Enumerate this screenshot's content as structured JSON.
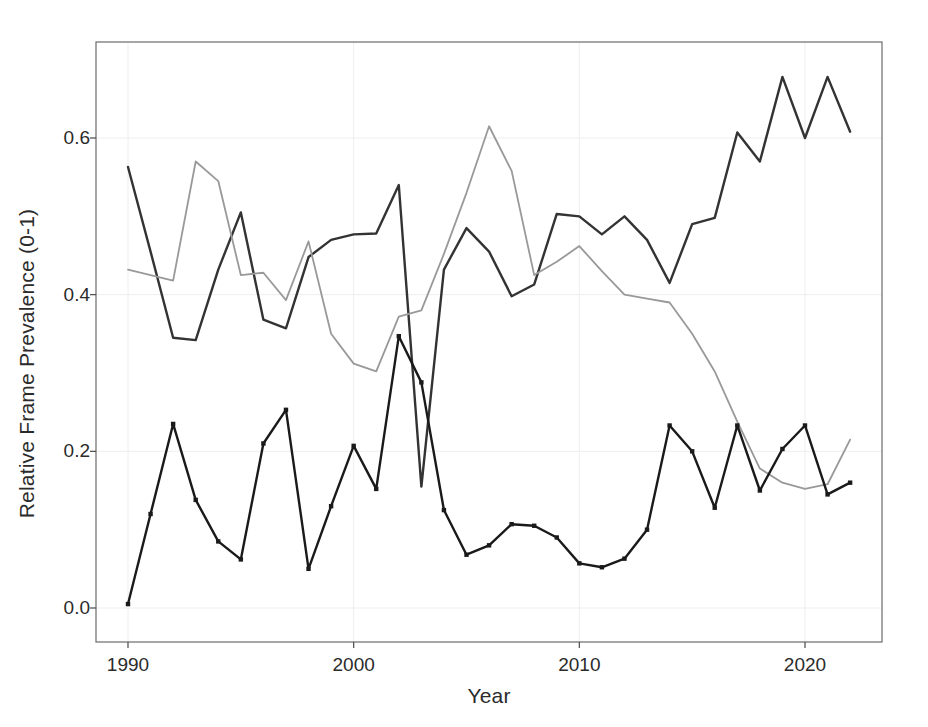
{
  "chart_data": {
    "type": "line",
    "title": "",
    "subtitle": "",
    "xlabel": "Year",
    "ylabel": "Relative Frame Prevalence (0-1)",
    "xlim": [
      1989.0,
      1989.0
    ],
    "ylim": [
      -0.035,
      0.715
    ],
    "xticks": [
      1990,
      2000,
      2010,
      2020
    ],
    "xtick_labels": [
      "1990",
      "2000",
      "2010",
      "2020"
    ],
    "yticks": [
      0.0,
      0.2,
      0.4,
      0.6
    ],
    "ytick_labels": [
      "0.0",
      "0.2",
      "0.4",
      "0.6"
    ],
    "grid": true,
    "grid_color": "#eeeeee",
    "legend": "none",
    "x": [
      1990,
      1991,
      1992,
      1993,
      1994,
      1995,
      1996,
      1997,
      1998,
      1999,
      2000,
      2001,
      2002,
      2003,
      2004,
      2005,
      2006,
      2007,
      2008,
      2009,
      2010,
      2011,
      2012,
      2013,
      2014,
      2015,
      2016,
      2017,
      2018,
      2019,
      2020,
      2021,
      2022
    ],
    "series": [
      {
        "name": "series-dark-upper",
        "color": "#333333",
        "markers": false,
        "linewidth": 2.4,
        "values": [
          0.563,
          0.455,
          0.345,
          0.342,
          0.432,
          0.505,
          0.368,
          0.357,
          0.448,
          0.47,
          0.477,
          0.478,
          0.54,
          0.155,
          0.432,
          0.485,
          0.455,
          0.398,
          0.413,
          0.503,
          0.5,
          0.477,
          0.5,
          0.47,
          0.415,
          0.49,
          0.498,
          0.607,
          0.57,
          0.678,
          0.6,
          0.678,
          0.608
        ]
      },
      {
        "name": "series-gray",
        "color": "#999999",
        "markers": false,
        "linewidth": 1.8,
        "values": [
          0.432,
          0.425,
          0.418,
          0.57,
          0.545,
          0.425,
          0.428,
          0.393,
          0.468,
          0.35,
          0.312,
          0.302,
          0.372,
          0.38,
          0.452,
          0.53,
          0.615,
          0.558,
          0.425,
          0.442,
          0.462,
          0.43,
          0.4,
          0.395,
          0.39,
          0.35,
          0.302,
          0.238,
          0.178,
          0.16,
          0.152,
          0.158,
          0.215
        ]
      },
      {
        "name": "series-dark-lower-markers",
        "color": "#1a1a1a",
        "markers": true,
        "linewidth": 2.4,
        "values": [
          0.005,
          0.12,
          0.235,
          0.138,
          0.085,
          0.062,
          0.21,
          0.253,
          0.05,
          0.13,
          0.207,
          0.152,
          0.347,
          0.288,
          0.125,
          0.068,
          0.08,
          0.107,
          0.105,
          0.09,
          0.057,
          0.052,
          0.063,
          0.1,
          0.233,
          0.2,
          0.128,
          0.233,
          0.15,
          0.203,
          0.233,
          0.145,
          0.16
        ]
      }
    ]
  },
  "axes": {
    "plot_left": 96,
    "plot_top": 42,
    "plot_right": 882,
    "plot_bottom": 642
  }
}
